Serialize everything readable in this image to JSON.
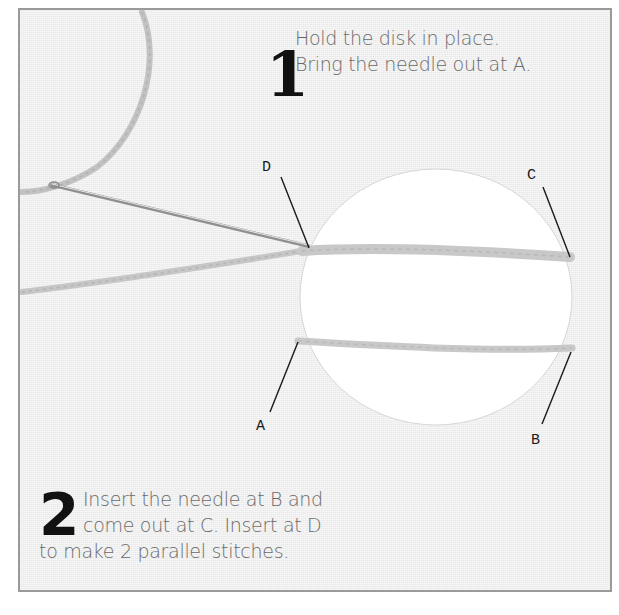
{
  "steps": [
    {
      "number": "1",
      "lines": [
        "Hold the disk in place.",
        "Bring the needle out at A."
      ]
    },
    {
      "number": "2",
      "lines": [
        "Insert the needle at B and",
        "come out at C. Insert at D",
        "to make 2 parallel stitches."
      ]
    }
  ],
  "points": {
    "A": "A",
    "B": "B",
    "C": "C",
    "D": "D"
  },
  "illustration": {
    "objects": [
      "fabric-background",
      "white-disk",
      "needle",
      "thread-loop",
      "upper-stitch",
      "lower-stitch"
    ],
    "colors": {
      "background": "#efefef",
      "disk": "#ffffff",
      "thread": "#c4c4c4",
      "needle": "#9a9a9a",
      "border": "#9a9a9a",
      "text": "#6a6a6a",
      "number": "#111111"
    }
  }
}
